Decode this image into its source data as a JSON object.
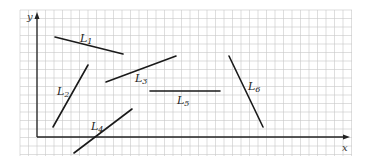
{
  "diagram": {
    "grid": {
      "x0": 20,
      "y0": 10,
      "x1": 352,
      "y1": 156,
      "spacing": 8.5,
      "color": "#c8c8c8"
    },
    "axes": {
      "origin": {
        "x": 37,
        "y": 137
      },
      "x_end": 350,
      "y_end": 12,
      "x_label": "x",
      "y_label": "y",
      "color": "#222222"
    },
    "segments": [
      {
        "id": "L1",
        "name": "L",
        "sub": "1",
        "x1": 55,
        "y1": 37,
        "x2": 123,
        "y2": 54,
        "lx": 80,
        "ly": 42
      },
      {
        "id": "L2",
        "name": "L",
        "sub": "2",
        "x1": 53,
        "y1": 127,
        "x2": 88,
        "y2": 65,
        "lx": 57,
        "ly": 95
      },
      {
        "id": "L3",
        "name": "L",
        "sub": "3",
        "x1": 106,
        "y1": 82,
        "x2": 176,
        "y2": 56,
        "lx": 135,
        "ly": 82
      },
      {
        "id": "L4",
        "name": "L",
        "sub": "4",
        "x1": 74,
        "y1": 153,
        "x2": 132,
        "y2": 109,
        "lx": 91,
        "ly": 130
      },
      {
        "id": "L5",
        "name": "L",
        "sub": "5",
        "x1": 150,
        "y1": 91,
        "x2": 220,
        "y2": 91,
        "lx": 177,
        "ly": 104
      },
      {
        "id": "L6",
        "name": "L",
        "sub": "6",
        "x1": 229,
        "y1": 56,
        "x2": 263,
        "y2": 127,
        "lx": 248,
        "ly": 90
      }
    ]
  }
}
